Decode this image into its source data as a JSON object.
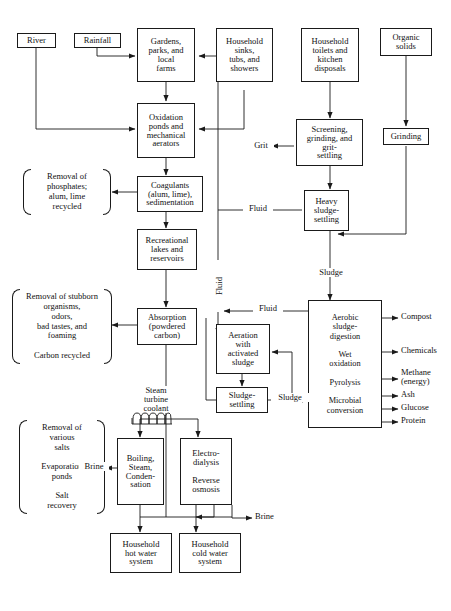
{
  "diagram": {
    "type": "flowchart",
    "stroke_color": "#1a1a1a",
    "background_color": "#ffffff"
  },
  "nodes": {
    "river": "River",
    "rainfall": "Rainfall",
    "gardens": "Gardens,\nparks, and\nlocal\nfarms",
    "household_sinks": "Household\nsinks,\ntubs, and\nshowers",
    "household_toilets": "Household\ntoilets and\nkitchen\ndisposals",
    "organic_solids": "Organic\nsolids",
    "oxidation_ponds": "Oxidation\nponds and\nmechanical\naerators",
    "screening": "Screening,\ngrinding, and\ngrit-\nsettling",
    "grinding": "Grinding",
    "coagulants": "Coagulants\n(alum, lime),\nsedimentation",
    "heavy_sludge": "Heavy\nsludge-\nsettling",
    "recreational": "Recreational\nlakes and\nreservoirs",
    "absorption": "Absorption\n(powdered\ncarbon)",
    "aeration": "Aeration\nwith\nactivated\nsludge",
    "aerobic_digestion": "Aerobic\nsludge-\ndigestion\n\nWet\noxidation\n\nPyrolysis\n\nMicrobial\nconversion",
    "sludge_settling": "Sludge-\nsettling",
    "boiling": "Boiling,\nSteam,\nConden-\nsation",
    "electrodialysis": "Electro-\ndialysis\n\nReverse\nosmosis",
    "hot_water": "Household\nhot water\nsystem",
    "cold_water": "Household\ncold water\nsystem"
  },
  "braces": {
    "phosphates": "Removal of\nphosphates;\nalum, lime\nrecycled",
    "stubborn": "Removal of stubborn\norganisms,\nodors,\nbad tastes, and\nfoaming\n\nCarbon recycled",
    "salts": "Removal of\nvarious\nsalts\n\nEvaporation\nponds\n\nSalt\nrecovery"
  },
  "edge_labels": {
    "grit": "Grit",
    "fluid_heavy": "Fluid",
    "sludge_main": "Sludge",
    "fluid_vertical": "Fluid",
    "fluid_aeration": "Fluid",
    "sludge_return": "Sludge",
    "steam_turbine": "Steam\nturbine\ncoolant",
    "brine_left": "Brine",
    "brine_right": "Brine"
  },
  "outputs": {
    "compost": "Compost",
    "chemicals": "Chemicals",
    "methane": "Methane\n(energy)",
    "ash": "Ash",
    "glucose": "Glucose",
    "protein": "Protein"
  }
}
